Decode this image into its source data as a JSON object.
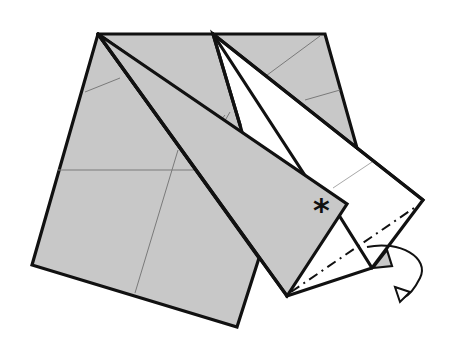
{
  "diagram": {
    "type": "origami-step",
    "colors": {
      "paper_colored": "#c8c8c8",
      "paper_white": "#ffffff",
      "outline": "#111111",
      "crease": "#7a7a7a"
    },
    "symbols": {
      "reference_mark": "*",
      "fold_line": "mountain-fold",
      "arrow": "fold-behind-arrow"
    }
  }
}
